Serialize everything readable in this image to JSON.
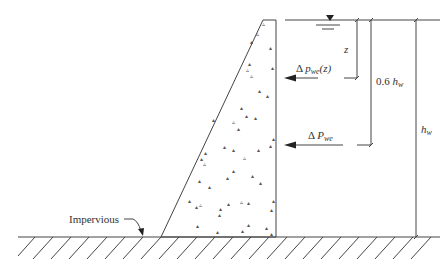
{
  "diagram": {
    "labels": {
      "impervious": "Impervious",
      "z": "z",
      "delta_p_symbol": "Δ",
      "delta_p_var": "p",
      "delta_p_sub": "we",
      "delta_p_arg": "(z)",
      "delta_P_symbol": "Δ",
      "delta_P_var": "P",
      "delta_P_sub": "we",
      "point6_coef": "0.6",
      "point6_var": "h",
      "point6_sub": "w",
      "hw_var": "h",
      "hw_sub": "w"
    },
    "icons": {
      "water_surface": "water-level-triangle-icon",
      "ground": "hatched-ground",
      "arrow": "arrow-left-icon"
    },
    "colors": {
      "line": "#444444",
      "text": "#333333",
      "background": "#ffffff"
    }
  }
}
